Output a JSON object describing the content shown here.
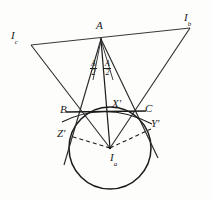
{
  "figure": {
    "type": "euclidean-geometry-diagram",
    "background_color": "#fdfdfc",
    "ink_color": "#1a1a1a"
  },
  "labels": {
    "vertex_a": "A",
    "vertex_b": "B",
    "vertex_c": "C",
    "excenter_a": "I",
    "excenter_a_sub": "a",
    "excenter_b": "I",
    "excenter_b_sub": "b",
    "excenter_c": "I",
    "excenter_c_sub": "c",
    "tangency_x": "X'",
    "tangency_y": "Y'",
    "tangency_z": "Z'",
    "half_angle_left_num": "A",
    "half_angle_left_den": "2",
    "half_angle_right_num": "A",
    "half_angle_right_den": "2"
  },
  "geometry": {
    "points": {
      "A": {
        "x": 101,
        "y": 38
      },
      "B": {
        "x": 70,
        "y": 112
      },
      "C": {
        "x": 142,
        "y": 112
      },
      "Ia": {
        "x": 110,
        "y": 148
      },
      "Ib": {
        "x": 191,
        "y": 27
      },
      "Ic": {
        "x": 30,
        "y": 43
      },
      "Xp": {
        "x": 110,
        "y": 112
      },
      "Yp": {
        "x": 150,
        "y": 128
      },
      "Zp": {
        "x": 70,
        "y": 136
      }
    },
    "excircle": {
      "center_x": 110,
      "center_y": 148,
      "radius": 41
    },
    "circumcircle_arc": {
      "center_x": 106,
      "center_y": 152,
      "radius": 45
    },
    "segments": [
      {
        "name": "line-Ic-Ib",
        "from": "Ic",
        "to": "Ib",
        "style": "solid"
      },
      {
        "name": "side-AB-extended",
        "from": "A",
        "to": "Zp",
        "style": "solid"
      },
      {
        "name": "side-AC-extended",
        "from": "A",
        "to": "Yp",
        "style": "solid"
      },
      {
        "name": "side-BC",
        "from": "B",
        "to": "C",
        "style": "solid"
      },
      {
        "name": "bisector-A-Ia",
        "from": "A",
        "to": "Ia",
        "style": "solid"
      },
      {
        "name": "line-Ic-Ia",
        "from": "Ic",
        "to": "Ia",
        "style": "solid"
      },
      {
        "name": "line-Ib-Ia",
        "from": "Ib",
        "to": "Ia",
        "style": "solid"
      },
      {
        "name": "radius-Ia-Zp",
        "from": "Ia",
        "to": "Zp",
        "style": "dashed"
      },
      {
        "name": "radius-Ia-Yp",
        "from": "Ia",
        "to": "Yp",
        "style": "dashed"
      }
    ],
    "tangency_notes": {
      "X'": "tangency point of excircle with side BC",
      "Y'": "tangency point of excircle with line AC extended",
      "Z'": "tangency point of excircle with line AB extended"
    }
  }
}
